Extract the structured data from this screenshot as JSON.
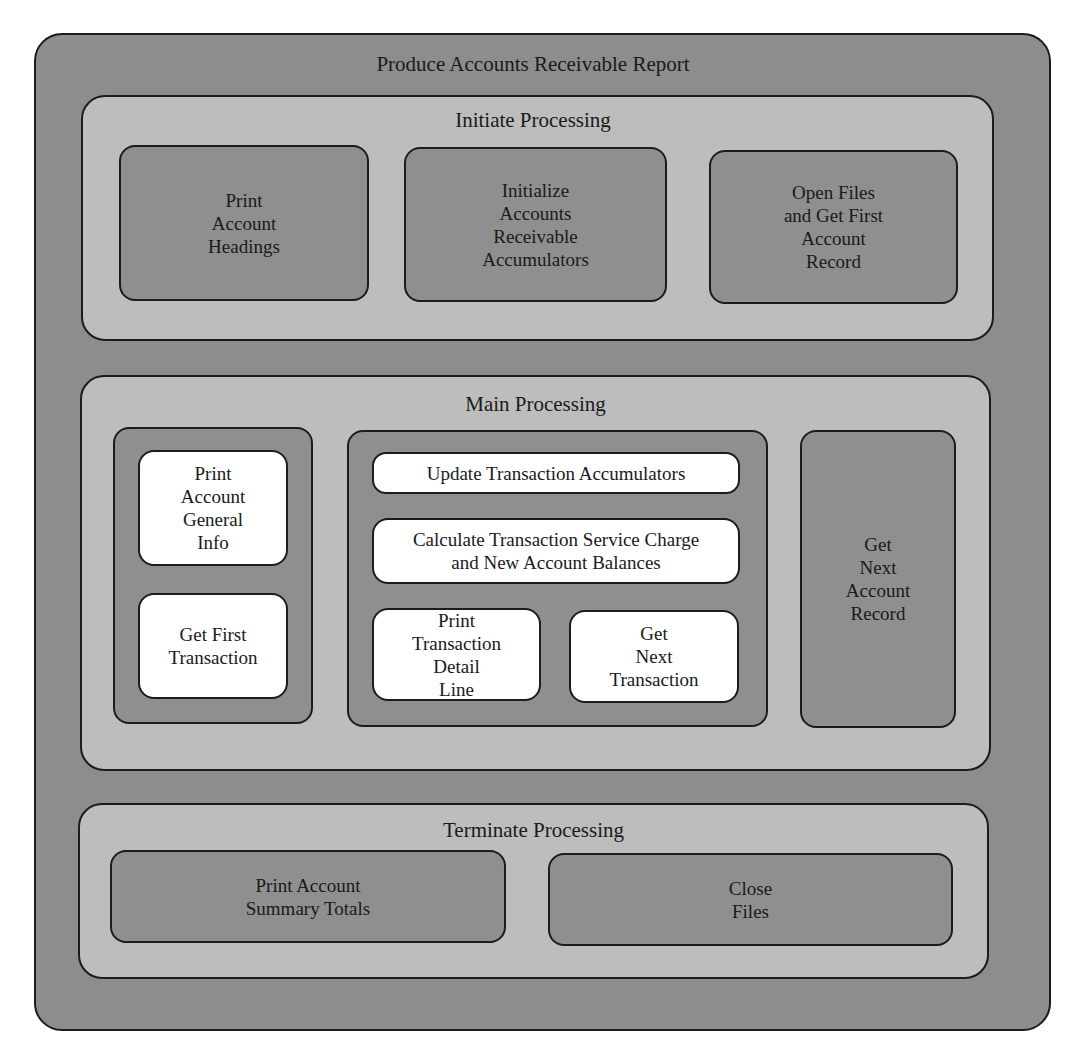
{
  "diagram": {
    "title": "Produce Accounts Receivable Report",
    "initiate": {
      "title": "Initiate Processing",
      "boxes": [
        {
          "label": "Print\nAccount\nHeadings"
        },
        {
          "label": "Initialize\nAccounts\nReceivable\nAccumulators"
        },
        {
          "label": "Open Files\nand Get  First\nAccount\nRecord"
        }
      ]
    },
    "main": {
      "title": "Main  Processing",
      "left_group": [
        {
          "label": "Print\nAccount\nGeneral\nInfo"
        },
        {
          "label": "Get First\nTransaction"
        }
      ],
      "middle_group": [
        {
          "label": "Update Transaction Accumulators"
        },
        {
          "label": "Calculate Transaction Service Charge\nand New Account Balances"
        },
        {
          "label": "Print\nTransaction\nDetail\nLine"
        },
        {
          "label": "Get\nNext\nTransaction"
        }
      ],
      "right_box": {
        "label": "Get\nNext\nAccount\nRecord"
      }
    },
    "terminate": {
      "title": "Terminate Processing",
      "boxes": [
        {
          "label": "Print Account\nSummary Totals"
        },
        {
          "label": "Close\nFiles"
        }
      ]
    },
    "colors": {
      "outer_fill": "#8d8d8d",
      "section_fill": "#bdbdbd",
      "module_fill": "#8f8f8f",
      "leaf_fill": "#ffffff",
      "border": "#1c1c1c"
    }
  }
}
